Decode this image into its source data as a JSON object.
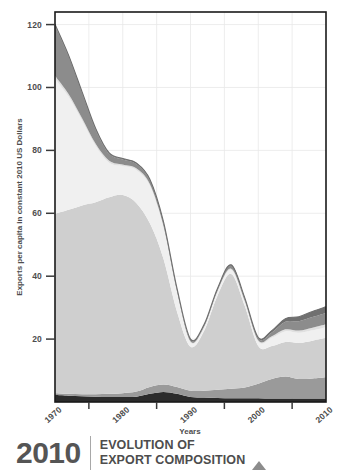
{
  "caption": {
    "year": "2010",
    "line1": "EVOLUTION OF",
    "line2": "EXPORT COMPOSITION",
    "triangle_icon": "triangle-up-icon"
  },
  "chart_data": {
    "type": "area",
    "title": "",
    "subtitle": "",
    "xlabel": "Years",
    "ylabel": "Exports per capita in constant 2010 US Dollars",
    "xlim": [
      1970,
      2010
    ],
    "ylim": [
      0,
      124
    ],
    "grid": true,
    "legend_position": "none",
    "stacked": true,
    "xticks": [
      1970,
      1980,
      1990,
      2000,
      2010
    ],
    "xtick_labels": [
      "1970",
      "1980",
      "1990",
      "2000",
      "2010"
    ],
    "xminor_ticks": [
      1975,
      1985,
      1995,
      2005
    ],
    "yticks": [
      20,
      40,
      60,
      80,
      100,
      120
    ],
    "ytick_labels": [
      "20",
      "40",
      "60",
      "80",
      "100",
      "120"
    ],
    "x": [
      1970,
      1972,
      1974,
      1976,
      1978,
      1980,
      1982,
      1984,
      1986,
      1988,
      1990,
      1992,
      1994,
      1996,
      1998,
      2000,
      2002,
      2004,
      2006,
      2008,
      2010
    ],
    "series": [
      {
        "name": "series-1-base-dark",
        "color": "#2b2b2b",
        "values": [
          2.2,
          2.0,
          1.8,
          1.7,
          1.6,
          1.6,
          1.7,
          2.6,
          3.2,
          2.6,
          1.6,
          1.4,
          1.3,
          1.2,
          1.2,
          1.2,
          1.1,
          1.1,
          1.1,
          1.1,
          1.1
        ]
      },
      {
        "name": "series-2-mid-gray",
        "color": "#9a9a9a",
        "values": [
          0.6,
          0.6,
          0.7,
          0.8,
          1.0,
          1.2,
          1.6,
          2.2,
          2.4,
          2.2,
          2.0,
          2.2,
          2.6,
          3.0,
          3.4,
          4.6,
          6.2,
          7.0,
          6.2,
          6.4,
          6.8
        ]
      },
      {
        "name": "series-3-main-light-gray",
        "color": "#cfcfcf",
        "values": [
          57.0,
          58.5,
          60.0,
          61.0,
          62.5,
          63.0,
          60.0,
          52.0,
          40.0,
          24.0,
          14.0,
          19.0,
          30.0,
          36.5,
          26.0,
          12.0,
          10.5,
          11.0,
          11.5,
          12.0,
          12.5
        ]
      },
      {
        "name": "series-4-pale",
        "color": "#f0f0f0",
        "values": [
          43.0,
          36.0,
          27.0,
          18.0,
          11.0,
          9.2,
          10.5,
          12.0,
          10.0,
          6.0,
          1.4,
          1.0,
          1.2,
          1.3,
          1.2,
          1.4,
          2.6,
          3.4,
          3.2,
          3.3,
          3.4
        ]
      },
      {
        "name": "series-5-thin-light",
        "color": "#e0e0e0",
        "values": [
          0.9,
          0.8,
          0.7,
          0.6,
          0.6,
          0.5,
          0.5,
          0.5,
          0.5,
          0.4,
          0.3,
          0.3,
          0.3,
          0.4,
          0.4,
          0.4,
          0.5,
          0.6,
          0.7,
          0.8,
          0.9
        ]
      },
      {
        "name": "series-6-upper-dark",
        "color": "#8c8c8c",
        "values": [
          16.0,
          12.0,
          8.0,
          4.5,
          2.2,
          1.6,
          1.4,
          1.2,
          1.0,
          0.8,
          0.5,
          0.5,
          0.6,
          0.9,
          0.7,
          0.6,
          1.2,
          2.4,
          3.0,
          3.4,
          3.6
        ]
      },
      {
        "name": "series-7-top-mid",
        "color": "#707070",
        "values": [
          0.4,
          0.4,
          0.4,
          0.4,
          0.3,
          0.3,
          0.3,
          0.3,
          0.3,
          0.2,
          0.2,
          0.2,
          0.2,
          0.3,
          0.3,
          0.3,
          0.6,
          1.0,
          1.4,
          1.8,
          2.0
        ]
      }
    ],
    "totals": [
      120.1,
      110.3,
      98.6,
      87.0,
      79.2,
      77.4,
      76.0,
      70.8,
      57.4,
      36.2,
      20.0,
      24.6,
      36.2,
      43.6,
      33.2,
      20.5,
      22.7,
      26.5,
      27.1,
      28.8,
      30.3
    ],
    "annotations": []
  }
}
